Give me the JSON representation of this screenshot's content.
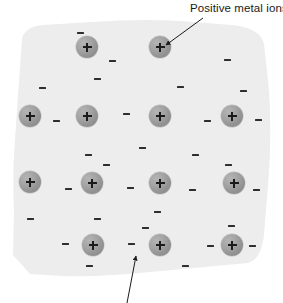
{
  "diagram": {
    "title_visible": false,
    "background_color": "#ececed",
    "ion_color": "#9a9a9a",
    "electron_color": "#2e2e2e",
    "text_color": "#1a1a1a",
    "canvas": {
      "width": 283,
      "height": 303
    }
  },
  "labels": [
    {
      "id": "positive-metal-ions",
      "text": "Positive metal ions",
      "x": 190,
      "y": 2
    }
  ],
  "arrows": [
    {
      "id": "arrow-to-ion",
      "points_to": "positive metal ion",
      "x1": 203,
      "y1": 18,
      "x2": 166,
      "y2": 45
    },
    {
      "id": "arrow-from-below",
      "points_to": "delocalised electron",
      "x1": 127,
      "y1": 303,
      "x2": 136,
      "y2": 256
    }
  ],
  "ions": [
    {
      "symbol": "+",
      "x": 87,
      "y": 47
    },
    {
      "symbol": "+",
      "x": 160,
      "y": 47
    },
    {
      "symbol": "+",
      "x": 30,
      "y": 116
    },
    {
      "symbol": "+",
      "x": 87,
      "y": 116
    },
    {
      "symbol": "+",
      "x": 160,
      "y": 116
    },
    {
      "symbol": "+",
      "x": 232,
      "y": 116
    },
    {
      "symbol": "+",
      "x": 30,
      "y": 182
    },
    {
      "symbol": "+",
      "x": 92,
      "y": 183
    },
    {
      "symbol": "+",
      "x": 160,
      "y": 183
    },
    {
      "symbol": "+",
      "x": 234,
      "y": 183
    },
    {
      "symbol": "+",
      "x": 93,
      "y": 245
    },
    {
      "symbol": "+",
      "x": 160,
      "y": 245
    },
    {
      "symbol": "+",
      "x": 232,
      "y": 245
    }
  ],
  "electrons": [
    {
      "symbol": "-",
      "x": 80,
      "y": 33
    },
    {
      "symbol": "-",
      "x": 112,
      "y": 61
    },
    {
      "symbol": "-",
      "x": 227,
      "y": 60
    },
    {
      "symbol": "-",
      "x": 97,
      "y": 79
    },
    {
      "symbol": "-",
      "x": 42,
      "y": 88
    },
    {
      "symbol": "-",
      "x": 180,
      "y": 87
    },
    {
      "symbol": "-",
      "x": 243,
      "y": 91
    },
    {
      "symbol": "-",
      "x": 56,
      "y": 121
    },
    {
      "symbol": "-",
      "x": 126,
      "y": 114
    },
    {
      "symbol": "-",
      "x": 207,
      "y": 121
    },
    {
      "symbol": "-",
      "x": 258,
      "y": 120
    },
    {
      "symbol": "-",
      "x": 142,
      "y": 148
    },
    {
      "symbol": "-",
      "x": 88,
      "y": 155
    },
    {
      "symbol": "-",
      "x": 195,
      "y": 155
    },
    {
      "symbol": "-",
      "x": 106,
      "y": 165
    },
    {
      "symbol": "-",
      "x": 228,
      "y": 165
    },
    {
      "symbol": "-",
      "x": 68,
      "y": 189
    },
    {
      "symbol": "-",
      "x": 130,
      "y": 188
    },
    {
      "symbol": "-",
      "x": 192,
      "y": 190
    },
    {
      "symbol": "-",
      "x": 256,
      "y": 190
    },
    {
      "symbol": "-",
      "x": 157,
      "y": 212
    },
    {
      "symbol": "-",
      "x": 30,
      "y": 219
    },
    {
      "symbol": "-",
      "x": 97,
      "y": 219
    },
    {
      "symbol": "-",
      "x": 145,
      "y": 228
    },
    {
      "symbol": "-",
      "x": 231,
      "y": 226
    },
    {
      "symbol": "-",
      "x": 65,
      "y": 244
    },
    {
      "symbol": "-",
      "x": 131,
      "y": 244
    },
    {
      "symbol": "-",
      "x": 210,
      "y": 246
    },
    {
      "symbol": "-",
      "x": 252,
      "y": 246
    },
    {
      "symbol": "-",
      "x": 89,
      "y": 266
    },
    {
      "symbol": "-",
      "x": 185,
      "y": 266
    }
  ]
}
